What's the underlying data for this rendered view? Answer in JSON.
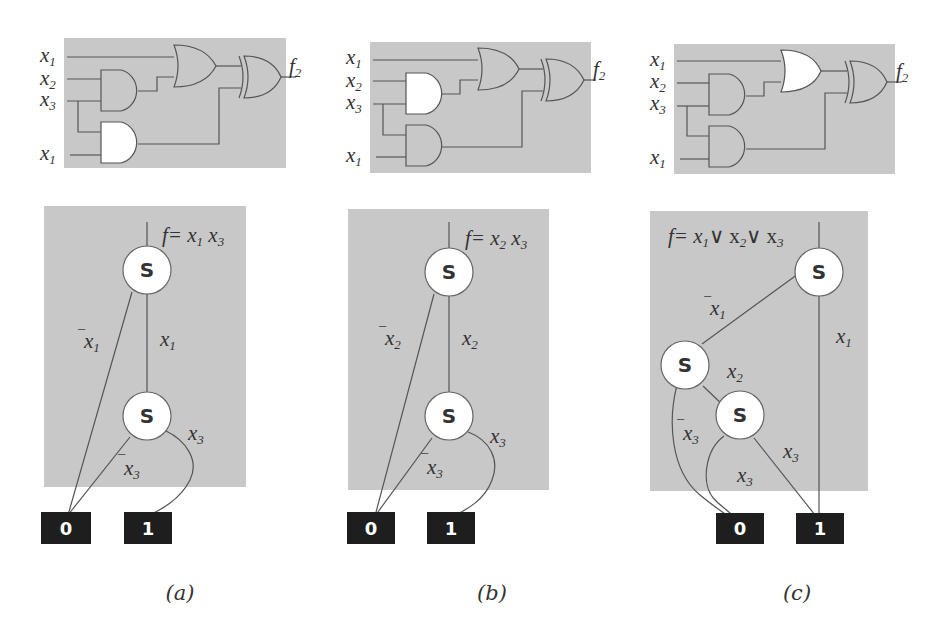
{
  "figure": {
    "panels": [
      {
        "id": "a",
        "caption": "(a)",
        "circuit": {
          "inputs": [
            "x1",
            "x2",
            "x3",
            "x1"
          ],
          "output": "f2",
          "highlighted_gate": "and-lower"
        },
        "graph": {
          "formula": "f= x1 x3",
          "nodes": [
            "S",
            "S"
          ],
          "edges": [
            "¯x1",
            "x1",
            "¯x3",
            "x3"
          ],
          "terminals": [
            "0",
            "1"
          ]
        }
      },
      {
        "id": "b",
        "caption": "(b)",
        "circuit": {
          "inputs": [
            "x1",
            "x2",
            "x3",
            "x1"
          ],
          "output": "f2",
          "highlighted_gate": "and-upper"
        },
        "graph": {
          "formula": "f= x2 x3",
          "nodes": [
            "S",
            "S"
          ],
          "edges": [
            "¯x2",
            "x2",
            "¯x3",
            "x3"
          ],
          "terminals": [
            "0",
            "1"
          ]
        }
      },
      {
        "id": "c",
        "caption": "(c)",
        "circuit": {
          "inputs": [
            "x1",
            "x2",
            "x3",
            "x1"
          ],
          "output": "f2",
          "highlighted_gate": "or"
        },
        "graph": {
          "formula": "f= x1∨ x2∨ x3",
          "nodes": [
            "S",
            "S",
            "S"
          ],
          "edges": [
            "¯x1",
            "x1",
            "x2",
            "¯x3",
            "x3",
            "x3"
          ],
          "terminals": [
            "0",
            "1"
          ]
        }
      }
    ]
  }
}
